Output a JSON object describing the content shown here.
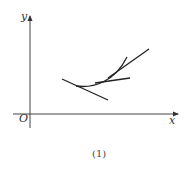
{
  "figure": {
    "caption": "(1)",
    "axes": {
      "x_label": "x",
      "y_label": "y",
      "origin_label": "O"
    },
    "elements": [
      {
        "name": "curve",
        "description": "convex increasing curve"
      },
      {
        "name": "tangent-line-left",
        "description": "tangent line with negative slope"
      },
      {
        "name": "tangent-line-middle",
        "description": "tangent line with small positive slope"
      },
      {
        "name": "secant-line-right",
        "description": "line with steep positive slope"
      }
    ],
    "colors": {
      "stroke": "#222222",
      "axis": "#444444"
    }
  }
}
